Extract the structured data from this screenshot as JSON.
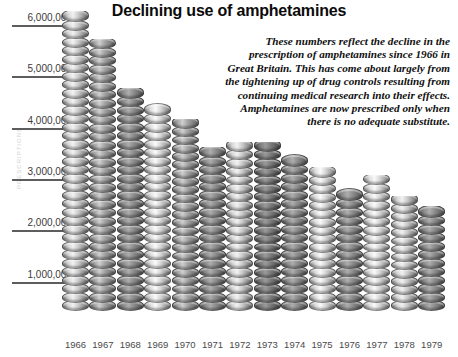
{
  "chart": {
    "title": "Declining use of amphetamines",
    "annotation": "These numbers reflect the decline in the prescription of amphetamines since 1966 in Great Britain. This has come about largely from the tightening up of drug controls resulting from continuing medical research into their effects. Amphetamines are now prescribed only when there is no adequate substitute.",
    "vertical_axis_caption": "PRESCRIPTIONS"
  },
  "chart_data": {
    "type": "bar",
    "title": "Declining use of amphetamines",
    "xlabel": "",
    "ylabel": "",
    "ylim": [
      0,
      6000000
    ],
    "grid": true,
    "legend": false,
    "categories": [
      "1966",
      "1967",
      "1968",
      "1969",
      "1970",
      "1971",
      "1972",
      "1973",
      "1974",
      "1975",
      "1976",
      "1977",
      "1978",
      "1979"
    ],
    "values": [
      5850000,
      5300000,
      4350000,
      4050000,
      3750000,
      3200000,
      3300000,
      3300000,
      3050000,
      2800000,
      2400000,
      2650000,
      2250000,
      2050000
    ],
    "ytick_labels": [
      "6,000,000",
      "5,000,000",
      "4,000,000",
      "3,000,000",
      "2,000,000",
      "1,000,000"
    ],
    "ytick_values": [
      6000000,
      5000000,
      4000000,
      3000000,
      2000000,
      1000000
    ],
    "annotation": "These numbers reflect the decline in the prescription of amphetamines since 1966 in Great Britain. This has come about largely from the tightening up of drug controls resulting from continuing medical research into their effects. Amphetamines are now prescribed only when there is no adequate substitute."
  },
  "style": {
    "background": "#ffffff",
    "title_color": "#0b0b0b",
    "gridline_color": "#5d5d5d",
    "tick_label_color": "#3a3a3a"
  }
}
